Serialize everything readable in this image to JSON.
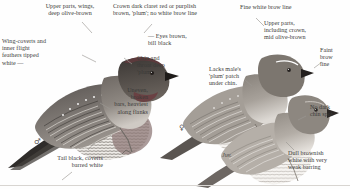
{
  "plate": {
    "title": "Bird identification plate",
    "background_color": "#fefefe",
    "text_color": "#3b3a38",
    "leader_color": "#9a9793"
  },
  "birds": [
    {
      "id": "male",
      "symbol": "♂",
      "caption": "",
      "position": "left"
    },
    {
      "id": "female",
      "symbol": "♀",
      "caption": "",
      "position": "centre"
    },
    {
      "id": "juvenile",
      "symbol": "",
      "caption": "Juv.",
      "position": "right"
    }
  ],
  "annotations": [
    {
      "id": "upper-parts-wings",
      "text": "Upper parts, wings,\ndeep olive-brown",
      "align": "center",
      "x": 22,
      "y": 3,
      "w": 96
    },
    {
      "id": "wing-coverts",
      "text": "Wing-coverts and\ninner flight\nfeathers tipped\nwhite   —",
      "align": "left",
      "x": 2,
      "y": 38,
      "w": 78
    },
    {
      "id": "crown-dark-claret",
      "text": "Crown dark claret red or purplish\nbrown, 'plum'; no white brow line",
      "align": "left",
      "x": 113,
      "y": 3,
      "w": 122
    },
    {
      "id": "eyes-brown-bill-black",
      "text": "—  Eyes brown,\nbill black",
      "align": "left",
      "x": 148,
      "y": 33,
      "w": 68
    },
    {
      "id": "chin-throat-plum",
      "text": "Chin and\nthroat deep\n'plum'",
      "align": "left",
      "x": 137,
      "y": 55,
      "w": 56
    },
    {
      "id": "uneven-broken-bars",
      "text": "Uneven,\nbroken\nbars, heaviest\nalong flanks",
      "align": "right",
      "x": 82,
      "y": 87,
      "w": 66
    },
    {
      "id": "tail-black-coverts",
      "text": "Tail black, coverts\nbarred white",
      "align": "right",
      "x": 20,
      "y": 155,
      "w": 83
    },
    {
      "id": "fine-white-brow-line",
      "text": "Fine white brow line",
      "align": "left",
      "x": 240,
      "y": 4,
      "w": 96
    },
    {
      "id": "upper-parts-including-crown",
      "text": "Upper parts,\nincluding crown,\nmid olive-brown",
      "align": "left",
      "x": 264,
      "y": 20,
      "w": 78
    },
    {
      "id": "faint-brow-line",
      "text": "Faint\nbrow\nline",
      "align": "left",
      "x": 320,
      "y": 47,
      "w": 28
    },
    {
      "id": "lacks-plum-patch",
      "text": "Lacks male's\n'plum' patch\nunder chin.",
      "align": "left",
      "x": 209,
      "y": 66,
      "w": 62
    },
    {
      "id": "no-dark-chin-spot",
      "text": "No dark\nchin spot",
      "align": "left",
      "x": 310,
      "y": 104,
      "w": 38
    },
    {
      "id": "dull-brownish-white",
      "text": "Dull brownish\nwhite with very\nweak barring",
      "align": "left",
      "x": 288,
      "y": 150,
      "w": 62
    }
  ]
}
